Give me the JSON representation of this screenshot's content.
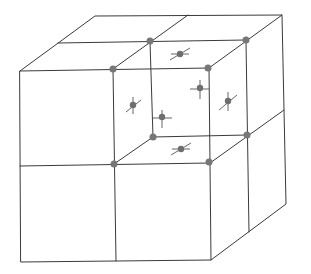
{
  "diagram": {
    "title": "",
    "colors": {
      "background": "#ffffff",
      "edge": "#3a3a3a",
      "atom": "#777777"
    },
    "outer_cube": {
      "front_face": {
        "tl": [
          20,
          71
        ],
        "tr": [
          209,
          68
        ],
        "br": [
          211,
          260
        ],
        "bl": [
          21,
          262
        ]
      },
      "back_offset": [
        75,
        -55
      ]
    },
    "highlighted_cell": {
      "corner_atoms": [
        {
          "id": "front-top-left",
          "x": 113,
          "y": 69
        },
        {
          "id": "front-top-right",
          "x": 208,
          "y": 68
        },
        {
          "id": "front-bottom-left",
          "x": 114,
          "y": 164
        },
        {
          "id": "front-bottom-right",
          "x": 209,
          "y": 162
        },
        {
          "id": "back-top-left",
          "x": 150,
          "y": 41
        },
        {
          "id": "back-top-right",
          "x": 246,
          "y": 40
        },
        {
          "id": "back-bottom-left",
          "x": 153,
          "y": 137
        },
        {
          "id": "back-bottom-right",
          "x": 247,
          "y": 135
        }
      ],
      "face_atoms": [
        {
          "id": "top-face",
          "x": 180,
          "y": 54
        },
        {
          "id": "bottom-face",
          "x": 181,
          "y": 149
        },
        {
          "id": "left-face",
          "x": 133,
          "y": 105
        },
        {
          "id": "right-face",
          "x": 228,
          "y": 101
        },
        {
          "id": "back-face",
          "x": 200,
          "y": 89
        },
        {
          "id": "front-face",
          "x": 162,
          "y": 117
        }
      ]
    }
  }
}
